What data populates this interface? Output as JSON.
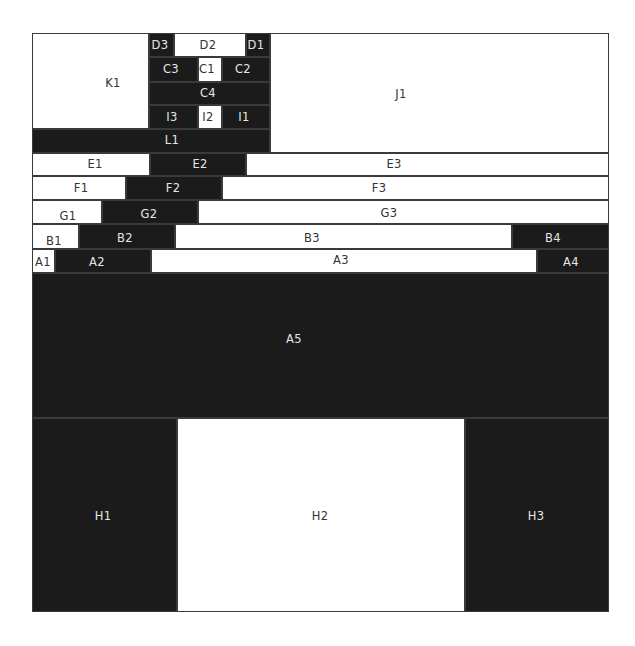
{
  "diagram": {
    "type": "treemap-mosaic",
    "colors": {
      "dark": "#1b1b1b",
      "light": "#ffffff",
      "border": "#3a3a3a",
      "text_dark": "#333333",
      "text_light": "#e6e6e6"
    },
    "frame": {
      "x": 32,
      "y": 33,
      "w": 577,
      "h": 579
    },
    "cells": [
      {
        "id": "K1",
        "label": "K1",
        "fill": "light",
        "x": 32,
        "y": 33,
        "w": 117,
        "h": 96,
        "lx": 113,
        "ly": 84
      },
      {
        "id": "D3",
        "label": "D3",
        "fill": "dark",
        "x": 149,
        "y": 33,
        "w": 25,
        "h": 24,
        "lx": 160,
        "ly": 46
      },
      {
        "id": "D2",
        "label": "D2",
        "fill": "light",
        "x": 174,
        "y": 33,
        "w": 72,
        "h": 24,
        "lx": 208,
        "ly": 46
      },
      {
        "id": "D1",
        "label": "D1",
        "fill": "dark",
        "x": 246,
        "y": 33,
        "w": 24,
        "h": 24,
        "lx": 256,
        "ly": 46
      },
      {
        "id": "C3",
        "label": "C3",
        "fill": "dark",
        "x": 149,
        "y": 57,
        "w": 49,
        "h": 25,
        "lx": 171,
        "ly": 70
      },
      {
        "id": "C1",
        "label": "C1",
        "fill": "light",
        "x": 198,
        "y": 57,
        "w": 24,
        "h": 25,
        "lx": 207,
        "ly": 70
      },
      {
        "id": "C2",
        "label": "C2",
        "fill": "dark",
        "x": 222,
        "y": 57,
        "w": 48,
        "h": 25,
        "lx": 243,
        "ly": 70
      },
      {
        "id": "C4",
        "label": "C4",
        "fill": "dark",
        "x": 149,
        "y": 82,
        "w": 121,
        "h": 23,
        "lx": 208,
        "ly": 94
      },
      {
        "id": "I3",
        "label": "I3",
        "fill": "dark",
        "x": 149,
        "y": 105,
        "w": 49,
        "h": 24,
        "lx": 172,
        "ly": 118
      },
      {
        "id": "I2",
        "label": "I2",
        "fill": "light",
        "x": 198,
        "y": 105,
        "w": 24,
        "h": 24,
        "lx": 208,
        "ly": 118
      },
      {
        "id": "I1",
        "label": "I1",
        "fill": "dark",
        "x": 222,
        "y": 105,
        "w": 48,
        "h": 24,
        "lx": 244,
        "ly": 118
      },
      {
        "id": "L1",
        "label": "L1",
        "fill": "dark",
        "x": 32,
        "y": 129,
        "w": 238,
        "h": 24,
        "lx": 172,
        "ly": 141
      },
      {
        "id": "J1",
        "label": "J1",
        "fill": "light",
        "x": 270,
        "y": 33,
        "w": 339,
        "h": 120,
        "lx": 401,
        "ly": 95
      },
      {
        "id": "E1",
        "label": "E1",
        "fill": "light",
        "x": 32,
        "y": 153,
        "w": 118,
        "h": 23,
        "lx": 95,
        "ly": 165
      },
      {
        "id": "E2",
        "label": "E2",
        "fill": "dark",
        "x": 150,
        "y": 153,
        "w": 96,
        "h": 23,
        "lx": 200,
        "ly": 165
      },
      {
        "id": "E3",
        "label": "E3",
        "fill": "light",
        "x": 246,
        "y": 153,
        "w": 363,
        "h": 23,
        "lx": 394,
        "ly": 165
      },
      {
        "id": "F1",
        "label": "F1",
        "fill": "light",
        "x": 32,
        "y": 176,
        "w": 94,
        "h": 24,
        "lx": 81,
        "ly": 189
      },
      {
        "id": "F2",
        "label": "F2",
        "fill": "dark",
        "x": 126,
        "y": 176,
        "w": 96,
        "h": 24,
        "lx": 173,
        "ly": 189
      },
      {
        "id": "F3",
        "label": "F3",
        "fill": "light",
        "x": 222,
        "y": 176,
        "w": 387,
        "h": 24,
        "lx": 379,
        "ly": 189
      },
      {
        "id": "G1",
        "label": "G1",
        "fill": "light",
        "x": 32,
        "y": 200,
        "w": 70,
        "h": 24,
        "lx": 68,
        "ly": 217
      },
      {
        "id": "G2",
        "label": "G2",
        "fill": "dark",
        "x": 102,
        "y": 200,
        "w": 96,
        "h": 24,
        "lx": 149,
        "ly": 215
      },
      {
        "id": "G3",
        "label": "G3",
        "fill": "light",
        "x": 198,
        "y": 200,
        "w": 411,
        "h": 24,
        "lx": 389,
        "ly": 214
      },
      {
        "id": "B1",
        "label": "B1",
        "fill": "light",
        "x": 32,
        "y": 224,
        "w": 47,
        "h": 25,
        "lx": 54,
        "ly": 242
      },
      {
        "id": "B2",
        "label": "B2",
        "fill": "dark",
        "x": 79,
        "y": 224,
        "w": 96,
        "h": 25,
        "lx": 125,
        "ly": 239
      },
      {
        "id": "B3",
        "label": "B3",
        "fill": "light",
        "x": 175,
        "y": 224,
        "w": 337,
        "h": 25,
        "lx": 312,
        "ly": 239
      },
      {
        "id": "B4",
        "label": "B4",
        "fill": "dark",
        "x": 512,
        "y": 224,
        "w": 97,
        "h": 25,
        "lx": 553,
        "ly": 239
      },
      {
        "id": "A1",
        "label": "A1",
        "fill": "light",
        "x": 32,
        "y": 249,
        "w": 23,
        "h": 24,
        "lx": 43,
        "ly": 263
      },
      {
        "id": "A2",
        "label": "A2",
        "fill": "dark",
        "x": 55,
        "y": 249,
        "w": 96,
        "h": 24,
        "lx": 97,
        "ly": 263
      },
      {
        "id": "A3",
        "label": "A3",
        "fill": "light",
        "x": 151,
        "y": 249,
        "w": 386,
        "h": 24,
        "lx": 341,
        "ly": 261
      },
      {
        "id": "A4",
        "label": "A4",
        "fill": "dark",
        "x": 537,
        "y": 249,
        "w": 72,
        "h": 24,
        "lx": 571,
        "ly": 263
      },
      {
        "id": "A5",
        "label": "A5",
        "fill": "dark",
        "x": 32,
        "y": 273,
        "w": 577,
        "h": 145,
        "lx": 294,
        "ly": 340
      },
      {
        "id": "H1",
        "label": "H1",
        "fill": "dark",
        "x": 32,
        "y": 418,
        "w": 145,
        "h": 194,
        "lx": 103,
        "ly": 517
      },
      {
        "id": "H2",
        "label": "H2",
        "fill": "light",
        "x": 177,
        "y": 418,
        "w": 288,
        "h": 194,
        "lx": 320,
        "ly": 517
      },
      {
        "id": "H3",
        "label": "H3",
        "fill": "dark",
        "x": 465,
        "y": 418,
        "w": 144,
        "h": 194,
        "lx": 536,
        "ly": 517
      }
    ]
  }
}
